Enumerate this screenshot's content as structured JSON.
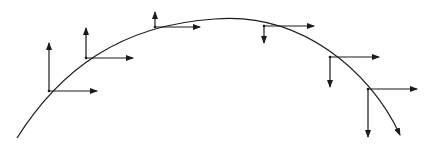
{
  "diagram": {
    "stroke_color": "#1a1a1a",
    "background": "#ffffff",
    "curve": {
      "start": [
        17,
        138
      ],
      "control1": [
        80,
        30
      ],
      "control2": [
        200,
        10
      ],
      "peak": [
        215,
        19
      ],
      "end": [
        400,
        135
      ],
      "has_end_arrow": true
    },
    "frames": [
      {
        "id": 1,
        "origin": [
          49,
          91
        ],
        "vertical": {
          "to": [
            49,
            43
          ],
          "direction": "up"
        },
        "horizontal": {
          "to": [
            97,
            91
          ],
          "direction": "right"
        }
      },
      {
        "id": 2,
        "origin": [
          86,
          58
        ],
        "vertical": {
          "to": [
            86,
            28
          ],
          "direction": "up"
        },
        "horizontal": {
          "to": [
            133,
            58
          ],
          "direction": "right"
        }
      },
      {
        "id": 3,
        "origin": [
          155,
          27
        ],
        "vertical": {
          "to": [
            155,
            12
          ],
          "direction": "up"
        },
        "horizontal": {
          "to": [
            200,
            27
          ],
          "direction": "right"
        }
      },
      {
        "id": 4,
        "origin": [
          264,
          26
        ],
        "vertical": {
          "to": [
            264,
            43
          ],
          "direction": "down"
        },
        "horizontal": {
          "to": [
            314,
            26
          ],
          "direction": "right"
        }
      },
      {
        "id": 5,
        "origin": [
          330,
          57
        ],
        "vertical": {
          "to": [
            330,
            87
          ],
          "direction": "down"
        },
        "horizontal": {
          "to": [
            379,
            57
          ],
          "direction": "right"
        }
      },
      {
        "id": 6,
        "origin": [
          368,
          89
        ],
        "vertical": {
          "to": [
            368,
            137
          ],
          "direction": "down"
        },
        "horizontal": {
          "to": [
            417,
            89
          ],
          "direction": "right"
        }
      }
    ]
  }
}
